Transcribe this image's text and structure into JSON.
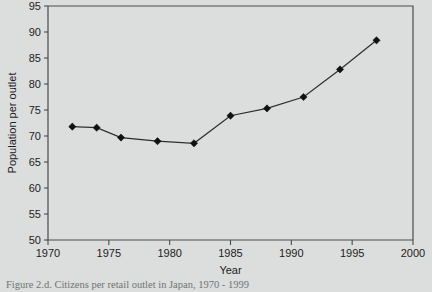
{
  "figure": {
    "caption": "Figure 2.d. Citizens per retail outlet in Japan, 1970 - 1999",
    "background_color": "#dcdedd",
    "line_color": "#2e2e2e",
    "marker_color": "#111111",
    "axis_color": "#4a4a4a"
  },
  "chart_data": {
    "type": "line",
    "title": "",
    "xlabel": "Year",
    "ylabel": "Population per outlet",
    "xlim": [
      1970,
      2000
    ],
    "ylim": [
      50,
      95
    ],
    "xticks": [
      1970,
      1975,
      1980,
      1985,
      1990,
      1995,
      2000
    ],
    "xtick_labels": [
      "1970",
      "1975",
      "1980",
      "1985",
      "1990",
      "1995",
      "2000"
    ],
    "yticks": [
      50,
      55,
      60,
      65,
      70,
      75,
      80,
      85,
      90,
      95
    ],
    "ytick_labels": [
      "50",
      "55",
      "60",
      "65",
      "70",
      "75",
      "80",
      "85",
      "90",
      "95"
    ],
    "grid": false,
    "legend": false,
    "legend_position": "none",
    "marker": "diamond",
    "x": [
      1972,
      1974,
      1976,
      1979,
      1982,
      1985,
      1988,
      1991,
      1994,
      1997
    ],
    "values": [
      71.8,
      71.6,
      69.7,
      69.0,
      68.6,
      73.9,
      75.3,
      77.5,
      82.8,
      88.4
    ],
    "series": [
      {
        "name": "Population per outlet",
        "x": [
          1972,
          1974,
          1976,
          1979,
          1982,
          1985,
          1988,
          1991,
          1994,
          1997
        ],
        "values": [
          71.8,
          71.6,
          69.7,
          69.0,
          68.6,
          73.9,
          75.3,
          77.5,
          82.8,
          88.4
        ]
      }
    ]
  }
}
